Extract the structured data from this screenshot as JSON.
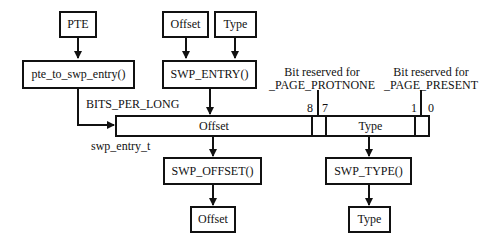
{
  "diagram": {
    "inputs": {
      "pte": "PTE",
      "offset": "Offset",
      "type": "Type"
    },
    "functions": {
      "pte_to_swp_entry": "pte_to_swp_entry()",
      "swp_entry": "SWP_ENTRY()",
      "swp_offset": "SWP_OFFSET()",
      "swp_type": "SWP_TYPE()"
    },
    "entry": {
      "type_name": "swp_entry_t",
      "width_label": "BITS_PER_LONG",
      "fields": {
        "offset": "Offset",
        "type": "Type"
      },
      "bit_labels": {
        "b8": "8",
        "b7": "7",
        "b1": "1",
        "b0": "0"
      }
    },
    "annotations": {
      "protnone": [
        "Bit reserved for",
        "_PAGE_PROTNONE"
      ],
      "present": [
        "Bit reserved for",
        "_PAGE_PRESENT"
      ]
    },
    "outputs": {
      "offset": "Offset",
      "type": "Type"
    }
  }
}
